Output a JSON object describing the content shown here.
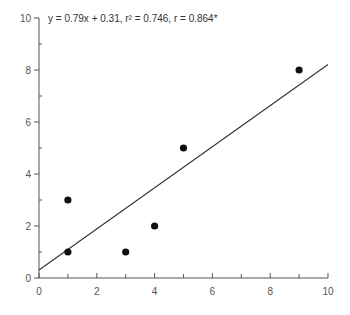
{
  "chart_data": {
    "type": "scatter",
    "title": "",
    "xlabel": "",
    "ylabel": "",
    "xlim": [
      0,
      10
    ],
    "ylim": [
      0,
      10
    ],
    "x_ticks": [
      0,
      2,
      4,
      6,
      8,
      10
    ],
    "y_ticks": [
      0,
      2,
      4,
      6,
      8,
      10
    ],
    "x_minor_ticks": [
      1,
      3,
      5,
      7,
      9
    ],
    "y_minor_ticks": [
      1,
      3,
      5,
      7,
      9
    ],
    "grid": false,
    "series": [
      {
        "name": "data",
        "points": [
          {
            "x": 1,
            "y": 1
          },
          {
            "x": 1,
            "y": 3
          },
          {
            "x": 3,
            "y": 1
          },
          {
            "x": 4,
            "y": 2
          },
          {
            "x": 5,
            "y": 5
          },
          {
            "x": 9,
            "y": 8
          }
        ]
      }
    ],
    "regression": {
      "slope": 0.79,
      "intercept": 0.31,
      "r_squared": 0.746,
      "r": 0.864,
      "x_range": [
        0,
        10
      ]
    },
    "annotation": "y = 0.79x + 0.31, r² = 0.746, r = 0.864*"
  },
  "colors": {
    "axis": "#555555",
    "point": "#111111",
    "line": "#333333"
  }
}
